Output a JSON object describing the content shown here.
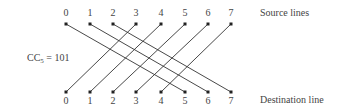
{
  "diagram": {
    "cc_label": "CC",
    "cc_subscript": "5",
    "cc_value": " = 101",
    "source_caption": "Source lines",
    "destination_caption": "Destination line",
    "nodes": [
      "0",
      "1",
      "2",
      "3",
      "4",
      "5",
      "6",
      "7"
    ],
    "node_x": [
      66,
      90,
      113,
      136,
      161,
      185,
      208,
      231
    ],
    "source_y": 24,
    "destination_y": 92,
    "shift": 5,
    "connections": [
      {
        "from": 0,
        "to": 5
      },
      {
        "from": 1,
        "to": 6
      },
      {
        "from": 2,
        "to": 7
      },
      {
        "from": 3,
        "to": 0
      },
      {
        "from": 4,
        "to": 1
      },
      {
        "from": 5,
        "to": 2
      },
      {
        "from": 6,
        "to": 3
      },
      {
        "from": 7,
        "to": 4
      }
    ],
    "line_color": "#333333"
  }
}
